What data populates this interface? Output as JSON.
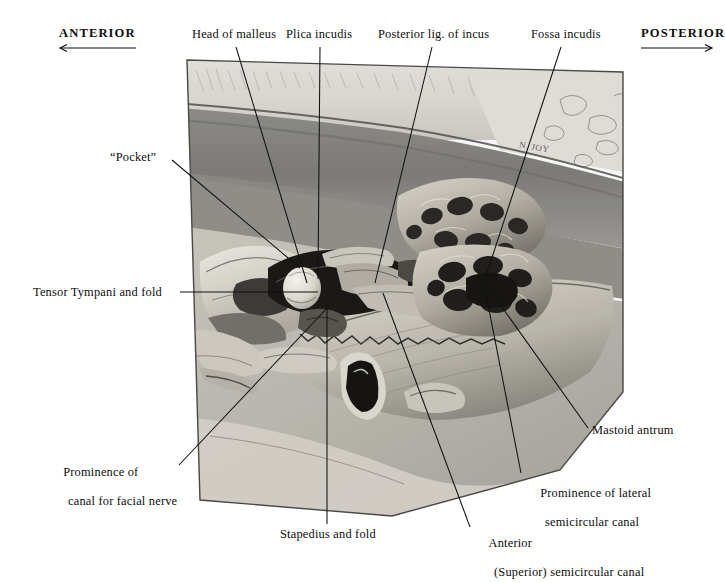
{
  "figure": {
    "kind": "anatomical-illustration",
    "signature": "N. JOY",
    "background_color": "#ffffff",
    "ink_color": "#0d0d0d",
    "plate_bounds": {
      "left": 185,
      "top": 58,
      "right": 623,
      "bottom": 518
    }
  },
  "orientation": {
    "anterior": {
      "label": "ANTERIOR",
      "arrow": "left"
    },
    "posterior": {
      "label": "POSTERIOR",
      "arrow": "right"
    }
  },
  "labels": {
    "head_of_malleus": "Head of malleus",
    "plica_incudis": "Plica incudis",
    "posterior_lig_of_incus": "Posterior lig. of incus",
    "fossa_incudis": "Fossa incudis",
    "pocket": "“Pocket”",
    "tensor_tympani": "Tensor Tympani and fold",
    "prominence_facial_l1": "Prominence of",
    "prominence_facial_l2": "canal for facial nerve",
    "stapedius": "Stapedius and fold",
    "anterior_scc_l1": "Anterior",
    "anterior_scc_l2": "(Superior) semicircular canal",
    "prominence_lateral_l1": "Prominence of lateral",
    "prominence_lateral_l2": "semicircular canal",
    "mastoid_antrum": "Mastoid antrum"
  }
}
